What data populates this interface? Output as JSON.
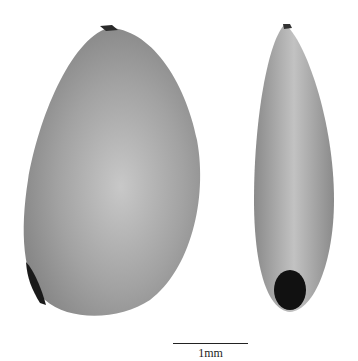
{
  "figure": {
    "specimens": [
      {
        "view": "lateral",
        "shape": "ovate/reniform",
        "tone": "grey"
      },
      {
        "view": "edge",
        "shape": "narrow elliptic",
        "tone": "grey",
        "feature": "dark hilum at base"
      }
    ],
    "scale_bar": {
      "label": "1mm"
    },
    "colors": {
      "seed": "#9a9a9a",
      "seed_highlight": "#c4c4c4",
      "hilum": "#111111",
      "background": "#ffffff"
    }
  }
}
